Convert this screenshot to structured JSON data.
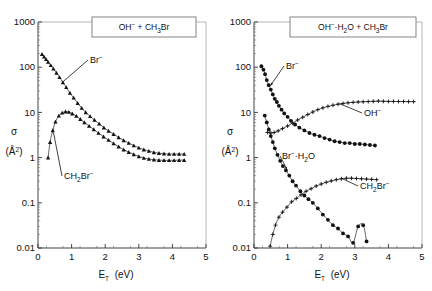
{
  "figure": {
    "panels": [
      {
        "id": "left",
        "title": "OH⁻ + CH₃Br",
        "title_parts": [
          "OH",
          "−",
          " + CH",
          "3",
          "Br"
        ],
        "xlabel_main": "E",
        "xlabel_sub": "T",
        "xlabel_unit": "(eV)",
        "ylabel_main": "σ",
        "ylabel_unit": "(Å²)",
        "xticks": [
          "0",
          "1",
          "2",
          "3",
          "4",
          "5"
        ],
        "yticks": [
          "1000",
          "100",
          "10",
          "1",
          "0.1",
          "0.01"
        ],
        "curve_labels": [
          {
            "name": "br-minus",
            "text": "Br⁻"
          },
          {
            "name": "ch2br-minus",
            "text": "CH₂Br⁻"
          }
        ]
      },
      {
        "id": "right",
        "title": "OH⁻·H₂O + CH₃Br",
        "xlabel_main": "E",
        "xlabel_sub": "T",
        "xlabel_unit": "(eV)",
        "ylabel_main": "σ",
        "ylabel_unit": "(Å²)",
        "xticks": [
          "0",
          "1",
          "2",
          "3",
          "4",
          "5"
        ],
        "yticks": [
          "1000",
          "100",
          "10",
          "1",
          "0.1",
          "0.01"
        ],
        "curve_labels": [
          {
            "name": "br-minus",
            "text": "Br⁻"
          },
          {
            "name": "br-h2o-minus",
            "text": "Br⁻·H₂O"
          },
          {
            "name": "oh-minus",
            "text": "OH⁻"
          },
          {
            "name": "ch2br-minus",
            "text": "CH₂Br⁻"
          }
        ]
      }
    ]
  },
  "chart_data": [
    {
      "type": "scatter",
      "panel": "left",
      "title": "OH⁻ + CH₃Br",
      "xlabel": "E_T (eV)",
      "ylabel": "σ (Å²)",
      "xlim": [
        0,
        5
      ],
      "ylim": [
        0.01,
        1000
      ],
      "yscale": "log",
      "xticks": [
        0,
        1,
        2,
        3,
        4,
        5
      ],
      "yticks": [
        0.01,
        0.1,
        1,
        10,
        100,
        1000
      ],
      "grid": false,
      "legend": "inline-annotations",
      "series": [
        {
          "name": "Br⁻",
          "marker": "filled-triangle",
          "points": [
            [
              0.12,
              195
            ],
            [
              0.18,
              170
            ],
            [
              0.24,
              150
            ],
            [
              0.3,
              130
            ],
            [
              0.38,
              110
            ],
            [
              0.46,
              92
            ],
            [
              0.55,
              75
            ],
            [
              0.64,
              60
            ],
            [
              0.74,
              46
            ],
            [
              0.84,
              36
            ],
            [
              0.95,
              27
            ],
            [
              1.06,
              21
            ],
            [
              1.18,
              16
            ],
            [
              1.3,
              12.5
            ],
            [
              1.42,
              10.0
            ],
            [
              1.55,
              8.2
            ],
            [
              1.68,
              6.8
            ],
            [
              1.82,
              5.6
            ],
            [
              1.96,
              4.6
            ],
            [
              2.1,
              3.9
            ],
            [
              2.25,
              3.3
            ],
            [
              2.4,
              2.8
            ],
            [
              2.55,
              2.4
            ],
            [
              2.7,
              2.1
            ],
            [
              2.85,
              1.85
            ],
            [
              3.0,
              1.65
            ],
            [
              3.15,
              1.5
            ],
            [
              3.3,
              1.4
            ],
            [
              3.45,
              1.3
            ],
            [
              3.6,
              1.25
            ],
            [
              3.75,
              1.22
            ],
            [
              3.9,
              1.2
            ],
            [
              4.05,
              1.2
            ],
            [
              4.2,
              1.2
            ],
            [
              4.35,
              1.2
            ]
          ]
        },
        {
          "name": "CH₂Br⁻",
          "marker": "filled-triangle",
          "points": [
            [
              0.3,
              1.0
            ],
            [
              0.36,
              2.2
            ],
            [
              0.44,
              4.0
            ],
            [
              0.52,
              6.2
            ],
            [
              0.62,
              8.4
            ],
            [
              0.72,
              9.8
            ],
            [
              0.82,
              10.4
            ],
            [
              0.92,
              10.2
            ],
            [
              1.02,
              9.4
            ],
            [
              1.14,
              8.3
            ],
            [
              1.26,
              7.1
            ],
            [
              1.38,
              6.0
            ],
            [
              1.52,
              5.0
            ],
            [
              1.66,
              4.2
            ],
            [
              1.8,
              3.5
            ],
            [
              1.95,
              2.9
            ],
            [
              2.1,
              2.45
            ],
            [
              2.25,
              2.05
            ],
            [
              2.4,
              1.75
            ],
            [
              2.55,
              1.5
            ],
            [
              2.7,
              1.32
            ],
            [
              2.85,
              1.18
            ],
            [
              3.0,
              1.06
            ],
            [
              3.15,
              0.98
            ],
            [
              3.3,
              0.93
            ],
            [
              3.45,
              0.9
            ],
            [
              3.6,
              0.88
            ],
            [
              3.75,
              0.87
            ],
            [
              3.9,
              0.87
            ],
            [
              4.05,
              0.87
            ],
            [
              4.2,
              0.88
            ],
            [
              4.35,
              0.88
            ]
          ]
        }
      ]
    },
    {
      "type": "scatter",
      "panel": "right",
      "title": "OH⁻·H₂O + CH₃Br",
      "xlabel": "E_T (eV)",
      "ylabel": "σ (Å²)",
      "xlim": [
        0,
        5
      ],
      "ylim": [
        0.01,
        1000
      ],
      "yscale": "log",
      "xticks": [
        0,
        1,
        2,
        3,
        4,
        5
      ],
      "yticks": [
        0.01,
        0.1,
        1,
        10,
        100,
        1000
      ],
      "grid": false,
      "legend": "inline-annotations",
      "series": [
        {
          "name": "Br⁻",
          "marker": "filled-circle",
          "points": [
            [
              0.22,
              105
            ],
            [
              0.28,
              88
            ],
            [
              0.33,
              70
            ],
            [
              0.38,
              52
            ],
            [
              0.44,
              40
            ],
            [
              0.5,
              32
            ],
            [
              0.56,
              25
            ],
            [
              0.62,
              20
            ],
            [
              0.68,
              17
            ],
            [
              0.74,
              14
            ],
            [
              0.82,
              11.5
            ],
            [
              0.9,
              9.5
            ],
            [
              1.0,
              8.0
            ],
            [
              1.1,
              6.5
            ],
            [
              1.22,
              5.4
            ],
            [
              1.35,
              4.6
            ],
            [
              1.5,
              4.0
            ],
            [
              1.65,
              3.5
            ],
            [
              1.8,
              3.2
            ],
            [
              1.95,
              3.0
            ],
            [
              2.1,
              2.7
            ],
            [
              2.25,
              2.5
            ],
            [
              2.4,
              2.3
            ],
            [
              2.55,
              2.2
            ],
            [
              2.7,
              2.1
            ],
            [
              2.85,
              2.1
            ],
            [
              3.0,
              2.0
            ],
            [
              3.15,
              2.0
            ],
            [
              3.3,
              1.95
            ],
            [
              3.45,
              1.9
            ],
            [
              3.6,
              1.85
            ]
          ]
        },
        {
          "name": "OH⁻",
          "marker": "plus-cross",
          "points": [
            [
              0.4,
              3.6
            ],
            [
              0.5,
              3.5
            ],
            [
              0.6,
              3.6
            ],
            [
              0.72,
              3.9
            ],
            [
              0.85,
              4.4
            ],
            [
              1.0,
              5.0
            ],
            [
              1.15,
              5.8
            ],
            [
              1.3,
              6.8
            ],
            [
              1.45,
              7.8
            ],
            [
              1.6,
              9.0
            ],
            [
              1.75,
              10.2
            ],
            [
              1.9,
              11.5
            ],
            [
              2.05,
              12.6
            ],
            [
              2.2,
              13.6
            ],
            [
              2.35,
              14.4
            ],
            [
              2.5,
              15.2
            ],
            [
              2.65,
              15.8
            ],
            [
              2.8,
              16.3
            ],
            [
              2.95,
              16.7
            ],
            [
              3.1,
              17.0
            ],
            [
              3.25,
              17.2
            ],
            [
              3.4,
              17.4
            ],
            [
              3.55,
              17.6
            ],
            [
              3.7,
              17.8
            ],
            [
              3.85,
              17.6
            ],
            [
              4.0,
              17.5
            ],
            [
              4.15,
              17.5
            ],
            [
              4.3,
              17.4
            ],
            [
              4.45,
              17.4
            ],
            [
              4.6,
              17.3
            ],
            [
              4.75,
              17.3
            ]
          ]
        },
        {
          "name": "Br⁻·H₂O",
          "marker": "filled-circle",
          "points": [
            [
              0.32,
              8.5
            ],
            [
              0.38,
              6.0
            ],
            [
              0.44,
              4.2
            ],
            [
              0.5,
              3.0
            ],
            [
              0.56,
              2.2
            ],
            [
              0.62,
              1.6
            ],
            [
              0.7,
              1.15
            ],
            [
              0.78,
              0.85
            ],
            [
              0.86,
              0.65
            ],
            [
              0.95,
              0.52
            ],
            [
              1.05,
              0.4
            ],
            [
              1.15,
              0.3
            ],
            [
              1.25,
              0.24
            ],
            [
              1.38,
              0.18
            ],
            [
              1.5,
              0.145
            ],
            [
              1.62,
              0.12
            ],
            [
              1.75,
              0.1
            ],
            [
              1.9,
              0.075
            ],
            [
              2.05,
              0.055
            ],
            [
              2.2,
              0.042
            ],
            [
              2.35,
              0.032
            ],
            [
              2.5,
              0.027
            ],
            [
              2.65,
              0.021
            ],
            [
              2.8,
              0.018
            ],
            [
              2.95,
              0.013
            ],
            [
              3.1,
              0.03
            ],
            [
              3.25,
              0.032
            ],
            [
              3.35,
              0.014
            ]
          ]
        },
        {
          "name": "CH₂Br⁻",
          "marker": "plus-cross",
          "points": [
            [
              0.48,
              0.011
            ],
            [
              0.56,
              0.02
            ],
            [
              0.64,
              0.032
            ],
            [
              0.74,
              0.048
            ],
            [
              0.85,
              0.062
            ],
            [
              0.98,
              0.08
            ],
            [
              1.12,
              0.105
            ],
            [
              1.26,
              0.125
            ],
            [
              1.4,
              0.15
            ],
            [
              1.55,
              0.18
            ],
            [
              1.7,
              0.205
            ],
            [
              1.85,
              0.235
            ],
            [
              2.0,
              0.26
            ],
            [
              2.15,
              0.285
            ],
            [
              2.3,
              0.305
            ],
            [
              2.45,
              0.325
            ],
            [
              2.6,
              0.34
            ],
            [
              2.75,
              0.35
            ],
            [
              2.9,
              0.35
            ],
            [
              3.05,
              0.345
            ],
            [
              3.2,
              0.34
            ],
            [
              3.35,
              0.335
            ],
            [
              3.5,
              0.33
            ],
            [
              3.65,
              0.325
            ]
          ]
        }
      ]
    }
  ]
}
